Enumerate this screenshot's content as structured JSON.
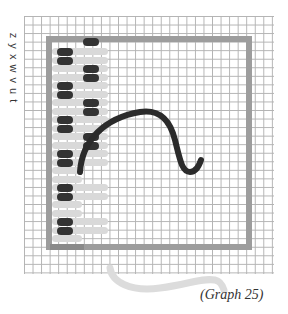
{
  "diagram": {
    "axis_label": "z y x w v u t",
    "caption": "(Graph 25)",
    "colors": {
      "grid": "#9a9a9a",
      "frame": "#9d9d9d",
      "oval": "#333333",
      "bar": "#d9d9d9",
      "curve": "#2b2b2b",
      "faint_curve": "#dcdcdc"
    }
  }
}
